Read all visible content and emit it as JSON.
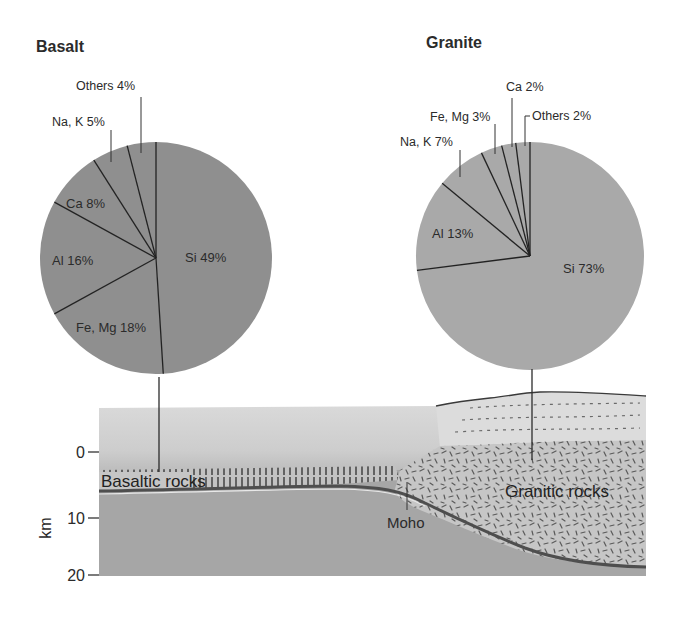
{
  "chart_data": [
    {
      "type": "pie",
      "title": "Basalt",
      "categories": [
        "Si",
        "Fe, Mg",
        "Al",
        "Ca",
        "Na, K",
        "Others"
      ],
      "values": [
        49,
        18,
        16,
        8,
        5,
        4
      ],
      "labels": [
        "Si 49%",
        "Fe, Mg 18%",
        "Al 16%",
        "Ca 8%",
        "Na, K 5%",
        "Others 4%"
      ],
      "color": "#8f8f8f"
    },
    {
      "type": "pie",
      "title": "Granite",
      "categories": [
        "Si",
        "Al",
        "Na, K",
        "Fe, Mg",
        "Ca",
        "Others"
      ],
      "values": [
        73,
        13,
        7,
        3,
        2,
        2
      ],
      "labels": [
        "Si 73%",
        "Al 13%",
        "Na, K 7%",
        "Fe, Mg 3%",
        "Ca 2%",
        "Others 2%"
      ],
      "color": "#a9a9a9"
    }
  ],
  "cross_section": {
    "axis_label": "km",
    "ticks": [
      "0",
      "10",
      "20"
    ],
    "labels": {
      "basaltic": "Basaltic rocks",
      "granitic": "Granitic rocks",
      "moho": "Moho"
    },
    "colors": {
      "mantle": "#a6a6a6",
      "ocean": "#c9c9c9",
      "basaltic_band": "#b9b9b9",
      "moho_line": "#555555",
      "granitic": "#c4c4c4",
      "continent_top": "#dadada"
    }
  }
}
